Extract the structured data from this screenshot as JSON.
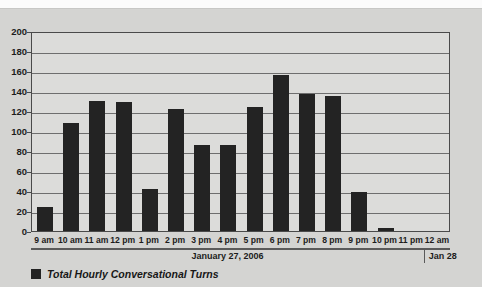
{
  "chart_data": {
    "type": "bar",
    "title": "",
    "subtitle": "",
    "xlabel": "",
    "ylabel": "",
    "ylim": [
      0,
      200
    ],
    "ytick_step": 20,
    "yticks": [
      200,
      180,
      160,
      140,
      120,
      100,
      80,
      60,
      40,
      20,
      0
    ],
    "grid": true,
    "legend_position": "bottom-left",
    "bar_color": "#232323",
    "plot_background": "#dcdcda",
    "page_background": "#d4d4d2",
    "axis_color": "#4a4a4a",
    "categories": [
      "9 am",
      "10 am",
      "11 am",
      "12 pm",
      "1 pm",
      "2 pm",
      "3 pm",
      "4 pm",
      "5 pm",
      "6 pm",
      "7 pm",
      "8 pm",
      "9 pm",
      "10 pm",
      "11 pm",
      "12 am"
    ],
    "values": [
      24,
      108,
      130,
      129,
      42,
      122,
      86,
      86,
      124,
      156,
      137,
      135,
      39,
      3,
      0,
      0
    ],
    "series": [
      {
        "name": "Total Hourly Conversational Turns",
        "values": [
          24,
          108,
          130,
          129,
          42,
          122,
          86,
          86,
          124,
          156,
          137,
          135,
          39,
          3,
          0,
          0
        ]
      }
    ],
    "legend": [
      "Total Hourly Conversational Turns"
    ],
    "date_bands": [
      {
        "label": "January 27, 2006",
        "start_category": "9 am",
        "end_category": "11 pm"
      },
      {
        "label": "Jan 28",
        "start_category": "12 am",
        "end_category": "12 am"
      }
    ]
  }
}
